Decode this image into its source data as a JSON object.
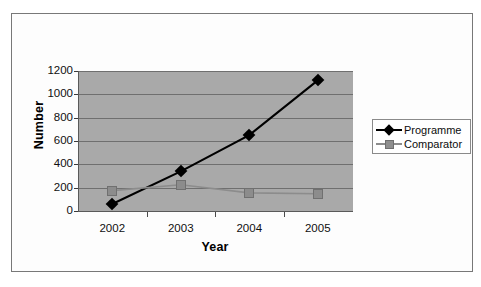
{
  "chart_data": {
    "type": "line",
    "title": "",
    "xlabel": "Year",
    "ylabel": "Number",
    "categories": [
      "2002",
      "2003",
      "2004",
      "2005"
    ],
    "x": [
      2002,
      2003,
      2004,
      2005
    ],
    "series": [
      {
        "name": "Programme",
        "values": [
          60,
          340,
          650,
          1120
        ],
        "color": "#000000",
        "marker": "diamond"
      },
      {
        "name": "Comparator",
        "values": [
          175,
          225,
          155,
          148
        ],
        "color": "#8c8c8c",
        "marker": "square"
      }
    ],
    "ylim": [
      0,
      1200
    ],
    "yticks": [
      0,
      200,
      400,
      600,
      800,
      1000,
      1200
    ],
    "ytick_labels": [
      "0",
      "200",
      "400",
      "600",
      "800",
      "1000",
      "1200"
    ],
    "xtick_labels": [
      "2002",
      "2003",
      "2004",
      "2005"
    ],
    "grid": true,
    "grid_axis": "y",
    "legend_position": "right",
    "plot_background": "#a9a9a9",
    "figure_background": "#ffffff"
  },
  "legend": {
    "entries": [
      {
        "label": "Programme"
      },
      {
        "label": "Comparator"
      }
    ]
  },
  "axes": {
    "y_title": "Number",
    "x_title": "Year"
  }
}
